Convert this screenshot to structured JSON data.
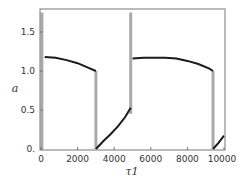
{
  "chart_data": {
    "type": "line",
    "title": "",
    "xlabel": "τ1",
    "ylabel": "a",
    "xlim": [
      0,
      10000
    ],
    "ylim": [
      0,
      1.8
    ],
    "grid": false,
    "legend": null,
    "x_ticks": [
      0,
      2000,
      4000,
      6000,
      8000,
      10000
    ],
    "x_tick_labels": [
      "0",
      "2000",
      "4000",
      "6000",
      "8000",
      "10000"
    ],
    "y_ticks": [
      0,
      0.5,
      1.0,
      1.5
    ],
    "y_tick_labels": [
      "0.",
      "0.5",
      "1.0",
      "1.5"
    ],
    "series": [
      {
        "name": "a(τ1) smooth branch",
        "color": "#1a1a1a",
        "segments": [
          {
            "x": [
              200,
              800,
              1400,
              2000,
              2600,
              3000
            ],
            "y": [
              1.18,
              1.17,
              1.14,
              1.1,
              1.04,
              1.0
            ]
          },
          {
            "x": [
              3000,
              3400,
              3800,
              4200,
              4600,
              4900
            ],
            "y": [
              0.0,
              0.1,
              0.19,
              0.29,
              0.41,
              0.53
            ]
          },
          {
            "x": [
              5000,
              5600,
              6200,
              6800,
              7400,
              8000,
              8600,
              9200,
              9400
            ],
            "y": [
              1.16,
              1.17,
              1.17,
              1.17,
              1.16,
              1.13,
              1.09,
              1.03,
              1.0
            ]
          },
          {
            "x": [
              9400,
              9700,
              10000
            ],
            "y": [
              0.0,
              0.08,
              0.17
            ]
          }
        ]
      },
      {
        "name": "a(τ1) jumps",
        "color": "#aaaaaa",
        "segments": [
          {
            "x": [
              50,
              50
            ],
            "y": [
              0.0,
              1.75
            ]
          },
          {
            "x": [
              3000,
              3000
            ],
            "y": [
              1.0,
              0.0
            ]
          },
          {
            "x": [
              4900,
              4900
            ],
            "y": [
              0.45,
              1.75
            ]
          },
          {
            "x": [
              9400,
              9400
            ],
            "y": [
              1.0,
              0.0
            ]
          }
        ]
      }
    ]
  }
}
